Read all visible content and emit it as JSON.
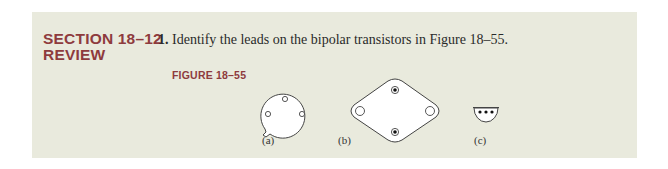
{
  "section": {
    "heading_line1": "SECTION 18–12",
    "heading_line2": "REVIEW",
    "heading_color": "#8e3b3d",
    "background_color": "#e9eadd"
  },
  "question": {
    "number": "1.",
    "text": " Identify the leads on the bipolar transistors in Figure 18–55."
  },
  "figure": {
    "label": "FIGURE 18–55",
    "items": [
      {
        "caption": "(a)",
        "description": "round metal can package (bottom view) with 3 leads and tab"
      },
      {
        "caption": "(b)",
        "description": "diamond TO-3 power package with 2 pins and 2 mounting holes"
      },
      {
        "caption": "(c)",
        "description": "half-round plastic TO-92 package with 3 leads"
      }
    ]
  }
}
